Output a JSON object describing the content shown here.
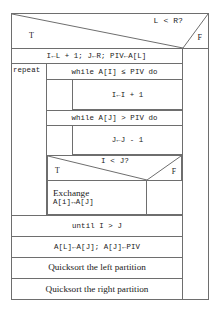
{
  "diagram": {
    "type": "nassi-shneiderman-structogram",
    "top_decision": {
      "condition": "L < R?",
      "true_label": "T",
      "false_label": "F"
    },
    "init_statement": "I←L + 1; J←R; PIV←A[L]",
    "repeat_label": "repeat",
    "while_i": {
      "header": "while A[I] ≤ PIV do",
      "body": "I←I + 1"
    },
    "while_j": {
      "header": "while A[J] > PIV do",
      "body": "J←J - 1"
    },
    "inner_decision": {
      "condition": "I < J?",
      "true_label": "T",
      "false_label": "F"
    },
    "exchange": {
      "line1": "Exchange",
      "line2": "A[i]↔A[J]"
    },
    "until_statement": "until I > J",
    "swap_pivot": "A[L]←A[J]; A[J]←PIV",
    "recurse_left": "Quicksort the left partition",
    "recurse_right": "Quicksort the right partition"
  },
  "colors": {
    "stroke": "#6e6e6e",
    "text": "#1a1a1a",
    "background": "#ffffff"
  }
}
